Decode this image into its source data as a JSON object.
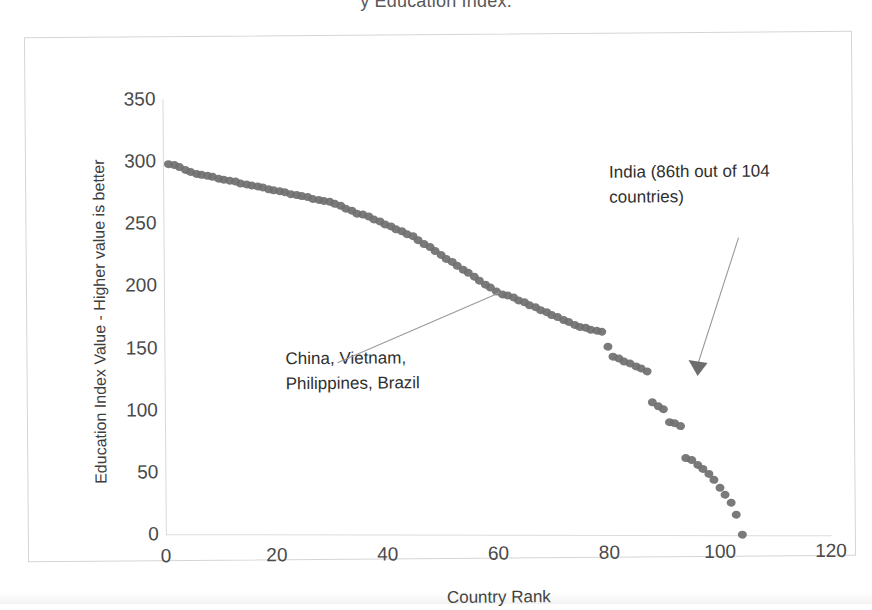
{
  "title_clipped": "y          Education Index.",
  "chart_data": {
    "type": "scatter",
    "title": "Education Index.",
    "xlabel": "Country Rank",
    "ylabel": "Education Index Value - Higher value is better",
    "xlim": [
      0,
      120
    ],
    "ylim": [
      0,
      350
    ],
    "xticks": [
      "0",
      "20",
      "40",
      "60",
      "80",
      "100",
      "120"
    ],
    "yticks": [
      "0",
      "50",
      "100",
      "150",
      "200",
      "250",
      "300",
      "350"
    ],
    "grid": false,
    "legend": "none",
    "marker_color": "#6f6f6f",
    "series": [
      {
        "name": "Education Index by Country Rank",
        "x": [
          1,
          2,
          3,
          4,
          5,
          6,
          7,
          8,
          9,
          10,
          11,
          12,
          13,
          14,
          15,
          16,
          17,
          18,
          19,
          20,
          21,
          22,
          23,
          24,
          25,
          26,
          27,
          28,
          29,
          30,
          31,
          32,
          33,
          34,
          35,
          36,
          37,
          38,
          39,
          40,
          41,
          42,
          43,
          44,
          45,
          46,
          47,
          48,
          49,
          50,
          51,
          52,
          53,
          54,
          55,
          56,
          57,
          58,
          59,
          60,
          61,
          62,
          63,
          64,
          65,
          66,
          67,
          68,
          69,
          70,
          71,
          72,
          73,
          74,
          75,
          76,
          77,
          78,
          79,
          80,
          81,
          82,
          83,
          84,
          85,
          86,
          87,
          88,
          89,
          90,
          91,
          92,
          93,
          94,
          95,
          96,
          97,
          98,
          99,
          100,
          101,
          102,
          103,
          104
        ],
        "y": [
          298,
          297,
          295,
          293,
          291,
          290,
          289,
          288,
          287,
          286,
          285,
          284,
          283,
          282,
          281,
          280,
          279,
          278,
          277,
          276,
          275,
          274,
          273,
          272,
          271,
          270,
          269,
          268,
          267,
          266,
          265,
          263,
          261,
          259,
          257,
          256,
          254,
          252,
          250,
          248,
          246,
          244,
          242,
          240,
          238,
          235,
          232,
          229,
          226,
          223,
          220,
          217,
          214,
          211,
          208,
          205,
          202,
          199,
          196,
          193,
          191,
          190,
          188,
          186,
          184,
          182,
          180,
          178,
          176,
          174,
          172,
          170,
          168,
          166,
          164,
          163,
          162,
          161,
          160,
          148,
          140,
          138,
          136,
          134,
          132,
          130,
          128,
          103,
          100,
          97,
          87,
          86,
          84,
          58,
          56,
          52,
          49,
          45,
          40,
          34,
          28,
          22,
          12,
          -4
        ]
      }
    ],
    "annotations": [
      {
        "name": "cluster-label",
        "text": "China, Vietnam,\nPhilippines, Brazil",
        "points_to_rank": 62,
        "points_to_value": 190
      },
      {
        "name": "india-label",
        "text": "India (86th out of 104\ncountries)",
        "points_to_rank": 86,
        "points_to_value": 130
      }
    ]
  },
  "annotations": {
    "cluster_label": "China, Vietnam,\nPhilippines, Brazil",
    "india_label": "India (86th out of 104\ncountries)"
  }
}
